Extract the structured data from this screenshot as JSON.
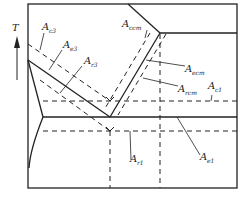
{
  "diagram": {
    "axis": {
      "label": "T",
      "direction": "up"
    },
    "labels": {
      "ac3": {
        "main": "A",
        "sub": "c3"
      },
      "ae3": {
        "main": "A",
        "sub": "e3"
      },
      "ar3": {
        "main": "A",
        "sub": "r3"
      },
      "accm": {
        "main": "A",
        "sub": "ccm"
      },
      "aecm": {
        "main": "A",
        "sub": "ecm"
      },
      "arcm": {
        "main": "A",
        "sub": "rcm"
      },
      "ac1": {
        "main": "A",
        "sub": "c1"
      },
      "ar1": {
        "main": "A",
        "sub": "r1"
      },
      "ae1": {
        "main": "A",
        "sub": "e1"
      }
    },
    "colors": {
      "line": "#222222",
      "background": "#ffffff"
    }
  }
}
